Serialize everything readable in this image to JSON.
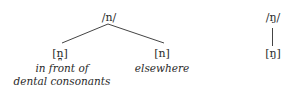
{
  "diagram": {
    "tree_n": {
      "phoneme": "/n/",
      "allophones": [
        {
          "symbol": "[n̪]",
          "context_lines": [
            "in front of",
            "dental consonants"
          ]
        },
        {
          "symbol": "[n]",
          "context_lines": [
            "elsewhere"
          ]
        }
      ]
    },
    "tree_ng": {
      "phoneme": "/ŋ/",
      "allophones": [
        {
          "symbol": "[ŋ]"
        }
      ]
    },
    "colors": {
      "text": "#2a2a2a",
      "line": "#444444",
      "background": "#ffffff"
    }
  }
}
